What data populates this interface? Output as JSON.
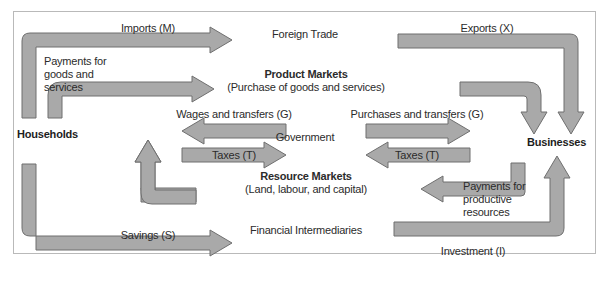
{
  "diagram": {
    "colors": {
      "arrow_fill": "#a9a9a9",
      "arrow_stroke": "#6f6f6f",
      "frame_border": "#b9b9b9",
      "text": "#2b2b2b",
      "background": "#ffffff"
    },
    "sectors": {
      "households": "Households",
      "businesses": "Businesses"
    },
    "markets": {
      "foreign_trade": "Foreign Trade",
      "product_markets_title": "Product Markets",
      "product_markets_sub": "(Purchase of goods and services)",
      "government": "Government",
      "resource_markets_title": "Resource Markets",
      "resource_markets_sub": "(Land, labour, and capital)",
      "financial_intermediaries": "Financial Intermediaries"
    },
    "flows": {
      "imports": "Imports (M)",
      "exports": "Exports (X)",
      "payments_goods_services": "Payments for goods and services",
      "wages_transfers": "Wages and transfers (G)",
      "purchases_transfers": "Purchases and transfers (G)",
      "taxes_left": "Taxes (T)",
      "taxes_right": "Taxes (T)",
      "payments_productive_resources": "Payments for productive resources",
      "savings": "Savings (S)",
      "investment": "Investment (I)"
    }
  }
}
